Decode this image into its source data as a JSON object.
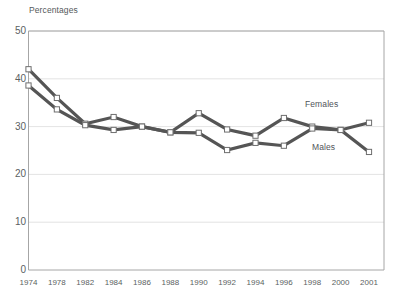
{
  "chart_data": {
    "type": "line",
    "title": "",
    "axis_note": "Percentages",
    "xlabel": "",
    "ylabel": "Percentages",
    "categories": [
      "1974",
      "1978",
      "1982",
      "1984",
      "1986",
      "1988",
      "1990",
      "1992",
      "1994",
      "1996",
      "1998",
      "2000",
      "2001"
    ],
    "x": [
      1974,
      1978,
      1982,
      1984,
      1986,
      1988,
      1990,
      1992,
      1994,
      1996,
      1998,
      2000,
      2001
    ],
    "ylim": [
      0,
      50
    ],
    "yticks": [
      "0",
      "10",
      "20",
      "30",
      "40",
      "50"
    ],
    "ytick_values": [
      0,
      10,
      20,
      30,
      40,
      50
    ],
    "grid": true,
    "legend": "inline-labels",
    "series": [
      {
        "name": "Females",
        "color": "#555555",
        "marker": "square",
        "values": [
          42.0,
          36.0,
          30.6,
          32.0,
          30.0,
          28.8,
          32.8,
          29.4,
          28.1,
          31.8,
          30.0,
          29.3,
          30.8
        ]
      },
      {
        "name": "Males",
        "color": "#555555",
        "marker": "square",
        "values": [
          38.6,
          33.6,
          30.3,
          29.3,
          30.0,
          28.8,
          28.7,
          25.1,
          26.6,
          26.0,
          29.6,
          29.3,
          24.7
        ]
      }
    ],
    "annotations": [
      {
        "text": "Females",
        "x_px": 305,
        "y_px": 99
      },
      {
        "text": "Males",
        "x_px": 312,
        "y_px": 142
      }
    ]
  },
  "colors": {
    "line": "#555555",
    "marker_fill": "#ffffff",
    "marker_stroke": "#6e6e6e",
    "grid": "#dcdcdc",
    "frame": "#a6a6a6",
    "text": "#5b5f62"
  }
}
